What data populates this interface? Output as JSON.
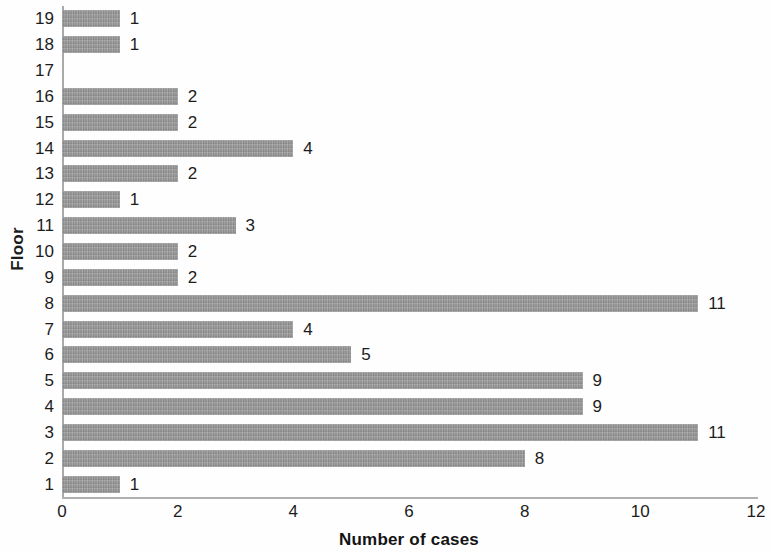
{
  "chart_data": {
    "type": "bar",
    "orientation": "horizontal",
    "title": "",
    "xlabel": "Number of cases",
    "ylabel": "Floor",
    "categories": [
      "19",
      "18",
      "17",
      "16",
      "15",
      "14",
      "13",
      "12",
      "11",
      "10",
      "9",
      "8",
      "7",
      "6",
      "5",
      "4",
      "3",
      "2",
      "1"
    ],
    "values": [
      1,
      1,
      0,
      2,
      2,
      4,
      2,
      1,
      3,
      2,
      2,
      11,
      4,
      5,
      9,
      9,
      11,
      8,
      1
    ],
    "data_labels": [
      "1",
      "1",
      "",
      "2",
      "2",
      "4",
      "2",
      "1",
      "3",
      "2",
      "2",
      "11",
      "4",
      "5",
      "9",
      "9",
      "11",
      "8",
      "1"
    ],
    "xlim": [
      0,
      12
    ],
    "x_ticks": [
      0,
      2,
      4,
      6,
      8,
      10,
      12
    ],
    "x_tick_labels": [
      "0",
      "2",
      "4",
      "6",
      "8",
      "10",
      "12"
    ],
    "grid": false,
    "legend": false,
    "bar_color": "#949494",
    "axis_color": "#aaaaaa",
    "text_color": "#1c1c1c"
  }
}
